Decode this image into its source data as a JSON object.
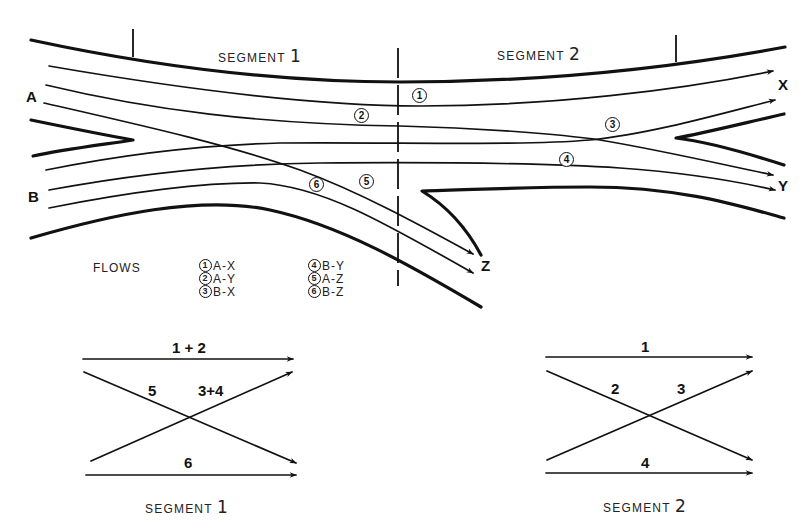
{
  "diagram": {
    "segments": [
      {
        "label": "SEGMENT",
        "number": "1"
      },
      {
        "label": "SEGMENT",
        "number": "2"
      }
    ],
    "origins": [
      "A",
      "B"
    ],
    "destinations": [
      "X",
      "Y",
      "Z"
    ],
    "flow_markers": [
      "1",
      "2",
      "3",
      "4",
      "5",
      "6"
    ],
    "legend": {
      "title": "FLOWS",
      "items": [
        {
          "num": "1",
          "od": "A-X"
        },
        {
          "num": "2",
          "od": "A-Y"
        },
        {
          "num": "3",
          "od": "B-X"
        },
        {
          "num": "4",
          "od": "B-Y"
        },
        {
          "num": "5",
          "od": "A-Z"
        },
        {
          "num": "6",
          "od": "B-Z"
        }
      ]
    },
    "schematic_segment1": {
      "caption_label": "SEGMENT",
      "caption_number": "1",
      "top_label": "1 + 2",
      "cross_left_label": "5",
      "cross_right_label": "3+4",
      "bottom_label": "6"
    },
    "schematic_segment2": {
      "caption_label": "SEGMENT",
      "caption_number": "2",
      "top_label": "1",
      "cross_left_label": "2",
      "cross_right_label": "3",
      "bottom_label": "4"
    }
  }
}
